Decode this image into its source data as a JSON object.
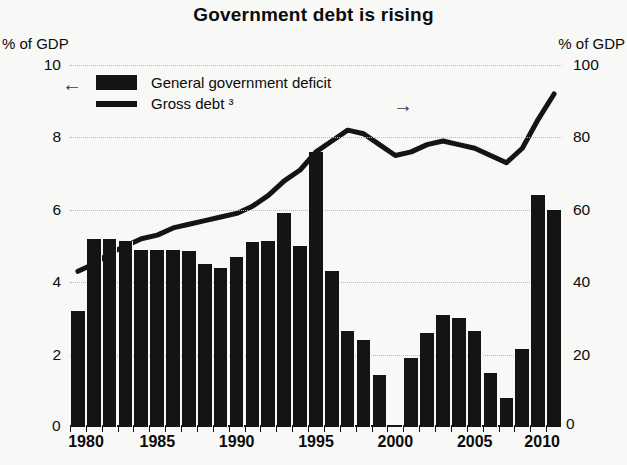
{
  "chart_data": {
    "type": "bar",
    "title": "Government debt is rising",
    "xlabel": "",
    "ylabel": "% of GDP",
    "y2label": "% of GDP",
    "ylim": [
      0,
      10
    ],
    "y2lim": [
      0,
      100
    ],
    "yticks": [
      0,
      2,
      4,
      6,
      8,
      10
    ],
    "y2ticks": [
      0,
      20,
      40,
      60,
      80,
      100
    ],
    "xticks": [
      1980,
      1985,
      1990,
      1995,
      2000,
      2005,
      2010
    ],
    "xlim": [
      1980,
      2010
    ],
    "grid": true,
    "legend_position": "top-left",
    "legend": [
      {
        "label": "General government deficit",
        "marker": "bar",
        "axis": "left",
        "arrow": "←"
      },
      {
        "label": "Gross debt ³",
        "marker": "line",
        "axis": "right",
        "arrow": "→"
      }
    ],
    "x": [
      1980,
      1981,
      1982,
      1983,
      1984,
      1985,
      1986,
      1987,
      1988,
      1989,
      1990,
      1991,
      1992,
      1993,
      1994,
      1995,
      1996,
      1997,
      1998,
      1999,
      2000,
      2001,
      2002,
      2003,
      2004,
      2005,
      2006,
      2007,
      2008,
      2009,
      2010
    ],
    "series": [
      {
        "name": "General government deficit",
        "type": "bar",
        "axis": "left",
        "unit": "% of GDP",
        "color": "#141414",
        "values": [
          3.2,
          5.2,
          5.2,
          5.15,
          4.9,
          4.9,
          4.9,
          4.85,
          4.5,
          4.4,
          4.7,
          5.1,
          5.15,
          5.9,
          5.0,
          7.6,
          4.3,
          2.65,
          2.4,
          1.45,
          0.05,
          1.9,
          2.6,
          3.1,
          3.0,
          2.65,
          1.5,
          0.8,
          2.15,
          6.4,
          6.0
        ]
      },
      {
        "name": "Gross debt ³",
        "type": "line",
        "axis": "right",
        "unit": "% of GDP",
        "color": "#141414",
        "values": [
          43,
          45,
          48,
          50,
          52,
          53,
          55,
          56,
          57,
          58,
          59,
          61,
          64,
          68,
          71,
          76,
          79,
          82,
          81,
          78,
          75,
          76,
          78,
          79,
          78,
          77,
          75,
          73,
          77,
          85,
          92
        ]
      }
    ]
  },
  "axes": {
    "left_unit": "% of GDP",
    "right_unit": "% of GDP",
    "left_zero": "0",
    "right_zero": "0"
  }
}
